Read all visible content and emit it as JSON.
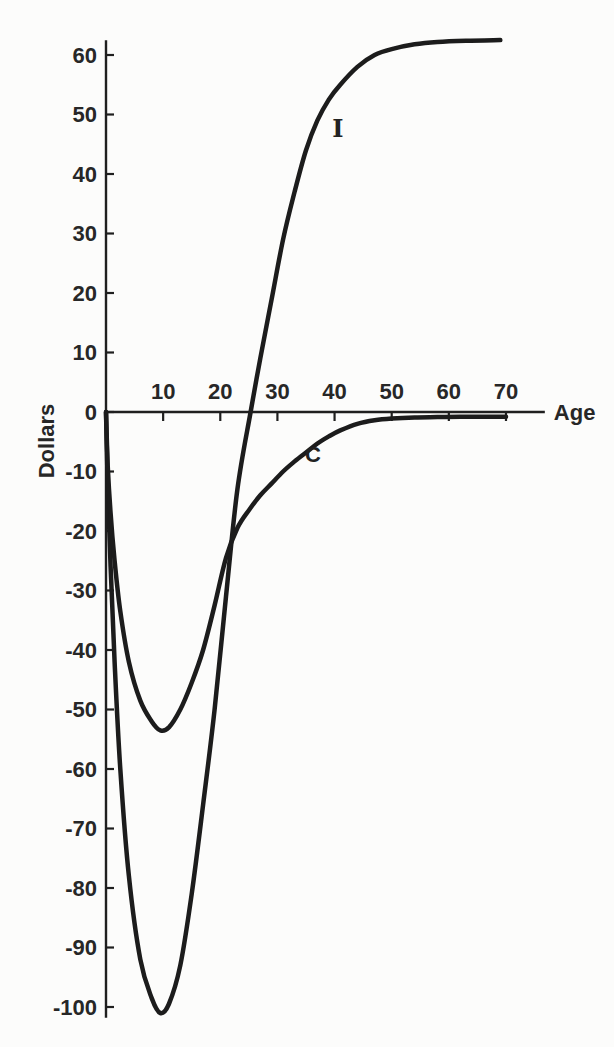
{
  "figure": {
    "background": "#fcfcfb",
    "ink_color": "#1c1c1c",
    "text_color": "#272727"
  },
  "chart_data": {
    "type": "line",
    "title": "",
    "xlabel": "Age",
    "ylabel": "Dollars",
    "grid": false,
    "legend": "inline-curve-labels",
    "x_axis": {
      "range": [
        0,
        76.8
      ],
      "tick_values": [
        10,
        20,
        30,
        40,
        50,
        60,
        70
      ],
      "tick_labels": [
        "10",
        "20",
        "30",
        "40",
        "50",
        "60",
        "70"
      ]
    },
    "y_axis": {
      "range": [
        -101.8,
        62.5
      ],
      "tick_values": [
        60,
        50,
        40,
        30,
        20,
        10,
        0,
        -10,
        -20,
        -30,
        -40,
        -50,
        -60,
        -70,
        -80,
        -90,
        -100
      ],
      "tick_labels": [
        "60",
        "50",
        "40",
        "30",
        "20",
        "10",
        "0",
        "-10",
        "-20",
        "-30",
        "-40",
        "-50",
        "-60",
        "-70",
        "-80",
        "-90",
        "-100"
      ]
    },
    "series": [
      {
        "name": "I",
        "label": "I",
        "label_pos": {
          "age": 40.6,
          "dollars": 47.7
        },
        "min_point": {
          "age": 9.5,
          "dollars": -101
        },
        "zero_crossing_age": 25.3,
        "plateau_value": 62.5,
        "points": [
          [
            0,
            0
          ],
          [
            0.3,
            -12
          ],
          [
            0.8,
            -26
          ],
          [
            1.5,
            -42
          ],
          [
            2.5,
            -60
          ],
          [
            4,
            -78
          ],
          [
            6,
            -92
          ],
          [
            8,
            -98.5
          ],
          [
            9.5,
            -101
          ],
          [
            11,
            -99.5
          ],
          [
            13,
            -93
          ],
          [
            15,
            -81
          ],
          [
            17,
            -66
          ],
          [
            19,
            -50
          ],
          [
            21,
            -31
          ],
          [
            23,
            -13
          ],
          [
            25.3,
            0
          ],
          [
            27,
            9
          ],
          [
            29,
            19
          ],
          [
            31,
            29
          ],
          [
            33,
            37
          ],
          [
            35,
            44
          ],
          [
            37,
            49
          ],
          [
            39,
            52.5
          ],
          [
            41,
            55
          ],
          [
            44,
            58
          ],
          [
            47,
            60
          ],
          [
            50,
            61
          ],
          [
            54,
            61.8
          ],
          [
            58,
            62.2
          ],
          [
            63,
            62.4
          ],
          [
            69,
            62.5
          ]
        ]
      },
      {
        "name": "C",
        "label": "C",
        "label_pos": {
          "age": 36.2,
          "dollars": -7.2
        },
        "min_point": {
          "age": 9.5,
          "dollars": -53.5
        },
        "asymptote_value": -0.8,
        "points": [
          [
            0,
            0
          ],
          [
            0.3,
            -9
          ],
          [
            0.8,
            -17
          ],
          [
            1.5,
            -25
          ],
          [
            2.5,
            -33.5
          ],
          [
            4,
            -42
          ],
          [
            6,
            -48.5
          ],
          [
            8,
            -52
          ],
          [
            9.5,
            -53.5
          ],
          [
            11,
            -53
          ],
          [
            13,
            -50
          ],
          [
            15,
            -45.5
          ],
          [
            17,
            -40
          ],
          [
            19,
            -32.5
          ],
          [
            21,
            -24.5
          ],
          [
            23,
            -19.5
          ],
          [
            25,
            -16.5
          ],
          [
            27,
            -14
          ],
          [
            29,
            -12
          ],
          [
            31,
            -10
          ],
          [
            33,
            -8.3
          ],
          [
            35,
            -6.8
          ],
          [
            37,
            -5.3
          ],
          [
            39,
            -4.1
          ],
          [
            41,
            -3.1
          ],
          [
            44,
            -2
          ],
          [
            47,
            -1.4
          ],
          [
            50,
            -1.1
          ],
          [
            54,
            -0.9
          ],
          [
            58,
            -0.85
          ],
          [
            62,
            -0.8
          ],
          [
            66,
            -0.8
          ],
          [
            70,
            -0.8
          ]
        ]
      }
    ]
  }
}
